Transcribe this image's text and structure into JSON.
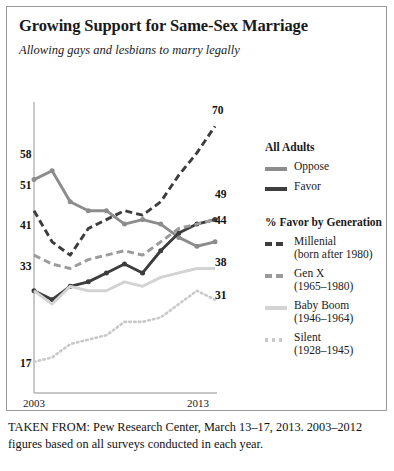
{
  "chart_data": {
    "type": "line",
    "title": "Growing Support for Same-Sex Marriage",
    "subtitle": "Allowing gays and lesbians to marry legally",
    "xlabel": "",
    "ylabel": "",
    "x": [
      2003,
      2004,
      2005,
      2006,
      2007,
      2008,
      2009,
      2010,
      2011,
      2012,
      2013
    ],
    "xtick_labels": [
      "2003",
      "2013"
    ],
    "ylim": [
      10,
      75
    ],
    "grid": false,
    "legend_position": "right",
    "series": [
      {
        "name": "Oppose",
        "group": "All Adults",
        "style": "solid",
        "color": "#8c8c8c",
        "values": [
          58,
          60,
          53,
          51,
          51,
          48,
          49,
          48,
          45,
          43,
          44
        ],
        "start_label": "58",
        "end_label": "44"
      },
      {
        "name": "Favor",
        "group": "All Adults",
        "style": "solid",
        "color": "#3d3d3d",
        "values": [
          33,
          31,
          34,
          35,
          37,
          39,
          37,
          42,
          46,
          48,
          49
        ],
        "start_label": "33",
        "end_label": "49"
      },
      {
        "name": "Millenial",
        "group": "% Favor by Generation",
        "sublabel": "(born after 1980)",
        "style": "dashed",
        "color": "#3d3d3d",
        "values": [
          51,
          44,
          41,
          47,
          49,
          51,
          50,
          53,
          59,
          64,
          70
        ],
        "start_label": "51",
        "end_label": "70"
      },
      {
        "name": "Gen X",
        "group": "% Favor by Generation",
        "sublabel": "(1965–1980)",
        "style": "dashed",
        "color": "#9b9b9b",
        "values": [
          41,
          39,
          38,
          40,
          41,
          42,
          41,
          44,
          47,
          48,
          49
        ],
        "start_label": "41",
        "end_label": "49"
      },
      {
        "name": "Baby Boom",
        "group": "% Favor by Generation",
        "sublabel": "(1946–1964)",
        "style": "solid",
        "color": "#d3d3d3",
        "values": [
          33,
          30,
          34,
          33,
          33,
          35,
          34,
          36,
          37,
          38,
          38
        ],
        "start_label": "33",
        "end_label": "38"
      },
      {
        "name": "Silent",
        "group": "% Favor by Generation",
        "sublabel": "(1928–1945)",
        "style": "dotted",
        "color": "#c9c9c9",
        "values": [
          17,
          18,
          21,
          22,
          23,
          26,
          26,
          27,
          30,
          33,
          31
        ],
        "start_label": "17",
        "end_label": "31"
      }
    ],
    "point_labels": [
      {
        "text": "58",
        "x": 13,
        "y": 141
      },
      {
        "text": "51",
        "x": 13,
        "y": 172
      },
      {
        "text": "41",
        "x": 13,
        "y": 212
      },
      {
        "text": "33",
        "x": 13,
        "y": 253
      },
      {
        "text": "17",
        "x": 13,
        "y": 350
      },
      {
        "text": "70",
        "x": 205,
        "y": 97
      },
      {
        "text": "49",
        "x": 208,
        "y": 181
      },
      {
        "text": "44",
        "x": 208,
        "y": 207
      },
      {
        "text": "38",
        "x": 208,
        "y": 249
      },
      {
        "text": "31",
        "x": 208,
        "y": 282
      }
    ]
  },
  "legend": {
    "group1_heading": "All Adults",
    "group2_heading": "% Favor by Generation",
    "items": [
      {
        "label": "Oppose",
        "sublabel": ""
      },
      {
        "label": "Favor",
        "sublabel": ""
      },
      {
        "label": "Millenial",
        "sublabel": "(born after 1980)"
      },
      {
        "label": "Gen X",
        "sublabel": "(1965–1980)"
      },
      {
        "label": "Baby Boom",
        "sublabel": "(1946–1964)"
      },
      {
        "label": "Silent",
        "sublabel": "(1928–1945)"
      }
    ]
  },
  "axis": {
    "x_start": "2003",
    "x_end": "2013"
  },
  "source_note": "TAKEN FROM: Pew Research Center, March 13–17, 2013. 2003–2012 figures based on all surveys conducted in each year."
}
